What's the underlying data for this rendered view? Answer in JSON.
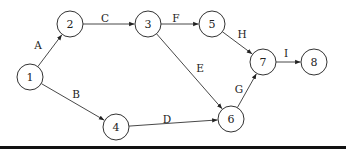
{
  "diagram": {
    "type": "activity-on-arrow network",
    "nodes": [
      {
        "id": "1",
        "label": "1",
        "x": 30,
        "y": 77
      },
      {
        "id": "2",
        "label": "2",
        "x": 70,
        "y": 24
      },
      {
        "id": "3",
        "label": "3",
        "x": 148,
        "y": 24
      },
      {
        "id": "4",
        "label": "4",
        "x": 116,
        "y": 127
      },
      {
        "id": "5",
        "label": "5",
        "x": 212,
        "y": 24
      },
      {
        "id": "6",
        "label": "6",
        "x": 231,
        "y": 119
      },
      {
        "id": "7",
        "label": "7",
        "x": 263,
        "y": 62
      },
      {
        "id": "8",
        "label": "8",
        "x": 314,
        "y": 62
      }
    ],
    "edges": [
      {
        "label": "A",
        "from": "1",
        "to": "2",
        "lx": 38,
        "ly": 45
      },
      {
        "label": "B",
        "from": "1",
        "to": "4",
        "lx": 76,
        "ly": 94
      },
      {
        "label": "C",
        "from": "2",
        "to": "3",
        "lx": 105,
        "ly": 18
      },
      {
        "label": "D",
        "from": "4",
        "to": "6",
        "lx": 167,
        "ly": 119
      },
      {
        "label": "E",
        "from": "3",
        "to": "6",
        "lx": 200,
        "ly": 68
      },
      {
        "label": "F",
        "from": "3",
        "to": "5",
        "lx": 176,
        "ly": 18
      },
      {
        "label": "G",
        "from": "6",
        "to": "7",
        "lx": 239,
        "ly": 89
      },
      {
        "label": "H",
        "from": "5",
        "to": "7",
        "lx": 242,
        "ly": 34
      },
      {
        "label": "I",
        "from": "7",
        "to": "8",
        "lx": 286,
        "ly": 53
      }
    ],
    "node_radius": 13
  }
}
